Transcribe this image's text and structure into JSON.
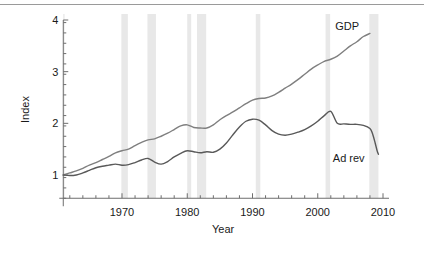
{
  "figure": {
    "background": "#ffffff",
    "top_rule_color": "#9a9a9a",
    "axis_color": "#6e6e6e",
    "recession_band_color": "#e8e8e8"
  },
  "chart_data": {
    "type": "line",
    "title": "",
    "xlabel": "Year",
    "ylabel": "Index",
    "xlim": [
      1961,
      2010
    ],
    "ylim": [
      0.55,
      4.0
    ],
    "grid": false,
    "legend": "inline-series-labels",
    "x_ticks_major": [
      1970,
      1980,
      1990,
      2000,
      2010
    ],
    "x_tick_labels": [
      "1970",
      "1980",
      "1990",
      "2000",
      "2010"
    ],
    "x_minor_tick_step": 2,
    "y_ticks_major": [
      1,
      2,
      3,
      4
    ],
    "y_tick_labels": [
      "1",
      "2",
      "3",
      "4"
    ],
    "y_minor_tick_step": 0.2,
    "recession_bands": [
      {
        "start": 1960.3,
        "end": 1961.2
      },
      {
        "start": 1969.9,
        "end": 1970.9
      },
      {
        "start": 1973.9,
        "end": 1975.2
      },
      {
        "start": 1980.0,
        "end": 1980.6
      },
      {
        "start": 1981.5,
        "end": 1982.9
      },
      {
        "start": 1990.5,
        "end": 1991.2
      },
      {
        "start": 2001.2,
        "end": 2001.9
      },
      {
        "start": 2007.9,
        "end": 2009.3
      }
    ],
    "series": [
      {
        "name": "GDP",
        "color": "#7f7f7f",
        "label_text": "GDP",
        "x": [
          1961,
          1962,
          1963,
          1964,
          1965,
          1966,
          1967,
          1968,
          1969,
          1970,
          1971,
          1972,
          1973,
          1974,
          1975,
          1976,
          1977,
          1978,
          1979,
          1980,
          1981,
          1982,
          1983,
          1984,
          1985,
          1986,
          1987,
          1988,
          1989,
          1990,
          1991,
          1992,
          1993,
          1994,
          1995,
          1996,
          1997,
          1998,
          1999,
          2000,
          2001,
          2002,
          2003,
          2004,
          2005,
          2006,
          2007,
          2008
        ],
        "values": [
          1.0,
          1.04,
          1.08,
          1.13,
          1.19,
          1.24,
          1.3,
          1.36,
          1.43,
          1.47,
          1.5,
          1.57,
          1.63,
          1.68,
          1.7,
          1.75,
          1.81,
          1.88,
          1.95,
          1.97,
          1.92,
          1.91,
          1.91,
          1.97,
          2.07,
          2.15,
          2.22,
          2.3,
          2.38,
          2.45,
          2.48,
          2.49,
          2.53,
          2.6,
          2.68,
          2.76,
          2.85,
          2.95,
          3.05,
          3.13,
          3.2,
          3.24,
          3.3,
          3.4,
          3.5,
          3.58,
          3.68,
          3.74
        ]
      },
      {
        "name": "Ad rev",
        "color": "#595959",
        "label_text": "Ad rev",
        "x": [
          1961,
          1962,
          1963,
          1964,
          1965,
          1966,
          1967,
          1968,
          1969,
          1970,
          1971,
          1972,
          1973,
          1974,
          1975,
          1976,
          1977,
          1978,
          1979,
          1980,
          1981,
          1982,
          1983,
          1984,
          1985,
          1986,
          1987,
          1988,
          1989,
          1990,
          1991,
          1992,
          1993,
          1994,
          1995,
          1996,
          1997,
          1998,
          1999,
          2000,
          2001,
          2002,
          2003,
          2004,
          2005,
          2006,
          2007,
          2008
        ],
        "values": [
          1.0,
          0.99,
          1.0,
          1.04,
          1.09,
          1.14,
          1.17,
          1.19,
          1.21,
          1.19,
          1.2,
          1.24,
          1.29,
          1.32,
          1.25,
          1.21,
          1.26,
          1.35,
          1.42,
          1.47,
          1.45,
          1.43,
          1.45,
          1.44,
          1.5,
          1.62,
          1.78,
          1.93,
          2.04,
          2.08,
          2.06,
          1.97,
          1.86,
          1.79,
          1.77,
          1.79,
          1.83,
          1.88,
          1.95,
          2.04,
          2.15,
          2.23,
          2.0,
          1.99,
          1.98,
          1.98,
          1.96,
          1.9
        ],
        "tail": [
          [
            2008.0,
            1.9
          ],
          [
            2008.4,
            1.8
          ],
          [
            2008.8,
            1.62
          ],
          [
            2009.1,
            1.47
          ],
          [
            2009.3,
            1.4
          ]
        ]
      }
    ]
  },
  "labels": {
    "y_axis_title": "Index",
    "x_axis_title": "Year",
    "gdp": "GDP",
    "ad_rev": "Ad rev"
  },
  "y_tick_positions_px": {
    "1": 175,
    "2": 114,
    "3": 68,
    "4": 20
  },
  "x_tick_positions_px": {
    "1970": 122,
    "1980": 187,
    "1990": 252,
    "2000": 317,
    "2010": 383
  }
}
